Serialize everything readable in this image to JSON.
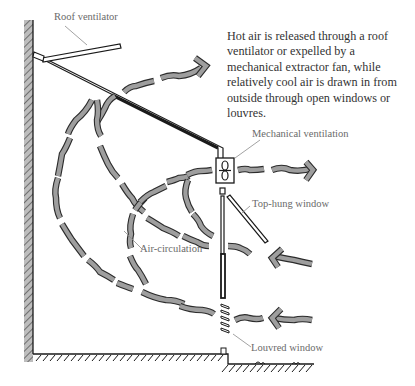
{
  "diagram": {
    "caption": "Hot air is released through a roof ventilator or expelled by a mechanical extractor fan, while relatively cool air is drawn in from outside through open windows or louvres.",
    "labels": {
      "roof_ventilator": "Roof ventilator",
      "mechanical_ventilation": "Mechanical ventilation",
      "top_hung_window": "Top-hung window",
      "air_circulation": "Air-circulation",
      "louvred_window": "Louvred window"
    },
    "colors": {
      "ink": "#1a1a1a",
      "air_stream_fill": "#9e9e9e",
      "wall_hatch": "#8a8a8a",
      "label_text": "#6a6a6a",
      "caption_text": "#333333"
    },
    "components": [
      {
        "id": "left-wall",
        "type": "wall"
      },
      {
        "id": "floor",
        "type": "ground"
      },
      {
        "id": "roof",
        "type": "sloped-roof"
      },
      {
        "id": "roof-ventilator",
        "type": "vent-flap"
      },
      {
        "id": "extractor-fan",
        "type": "mechanical-fan"
      },
      {
        "id": "top-hung-window",
        "type": "window"
      },
      {
        "id": "louvred-window",
        "type": "louvres"
      }
    ],
    "flows": [
      {
        "from": "room",
        "to": "roof-ventilator",
        "direction": "out",
        "arrow": "right"
      },
      {
        "from": "room",
        "to": "extractor-fan",
        "direction": "out",
        "arrow": "right"
      },
      {
        "from": "outside",
        "to": "top-hung-window",
        "direction": "in",
        "arrow": "left"
      },
      {
        "from": "outside",
        "to": "louvred-window",
        "direction": "in",
        "arrow": "left"
      }
    ]
  }
}
